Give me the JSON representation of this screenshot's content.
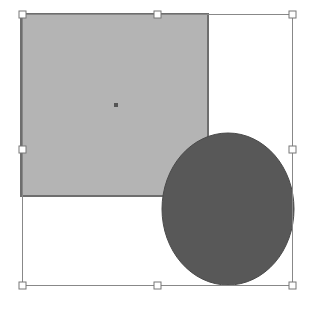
{
  "canvas": {
    "width": 317,
    "height": 313,
    "background": "#ffffff"
  },
  "shapes": {
    "rectangle": {
      "x": 21,
      "y": 14,
      "width": 187,
      "height": 182,
      "fill": "#b4b4b4",
      "stroke": "#6e6e6e"
    },
    "rectangle_center_point": {
      "x": 116,
      "y": 105,
      "size": 4,
      "fill": "#555555"
    },
    "ellipse": {
      "cx": 228,
      "cy": 209,
      "rx": 66,
      "ry": 76,
      "fill": "#585858",
      "stroke": "#4a4a4a"
    }
  },
  "selection": {
    "bounding_box": {
      "x": 22,
      "y": 14,
      "width": 270,
      "height": 271,
      "stroke": "#888888"
    },
    "handles": [
      {
        "name": "top-left",
        "x": 22,
        "y": 14
      },
      {
        "name": "top-middle",
        "x": 157,
        "y": 14
      },
      {
        "name": "top-right",
        "x": 292,
        "y": 14
      },
      {
        "name": "middle-left",
        "x": 22,
        "y": 149
      },
      {
        "name": "middle-right",
        "x": 292,
        "y": 149
      },
      {
        "name": "bottom-left",
        "x": 22,
        "y": 285
      },
      {
        "name": "bottom-middle",
        "x": 157,
        "y": 285
      },
      {
        "name": "bottom-right",
        "x": 292,
        "y": 285
      }
    ],
    "handle_size": 7,
    "handle_fill": "#ffffff",
    "handle_stroke": "#777777"
  }
}
